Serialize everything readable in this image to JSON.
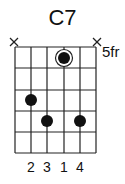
{
  "chord": {
    "name": "C7",
    "start_fret_label": "5fr",
    "strings_muted": [
      "string-6",
      "string-1"
    ],
    "fingers": [
      "2",
      "3",
      "1",
      "4"
    ],
    "dots": [
      {
        "string": 4,
        "fret": 1,
        "finger": "1",
        "root": true
      },
      {
        "string": 6,
        "fret": 3,
        "finger": "2"
      },
      {
        "string": 5,
        "fret": 4,
        "finger": "3"
      },
      {
        "string": 3,
        "fret": 4,
        "finger": "4"
      }
    ]
  }
}
